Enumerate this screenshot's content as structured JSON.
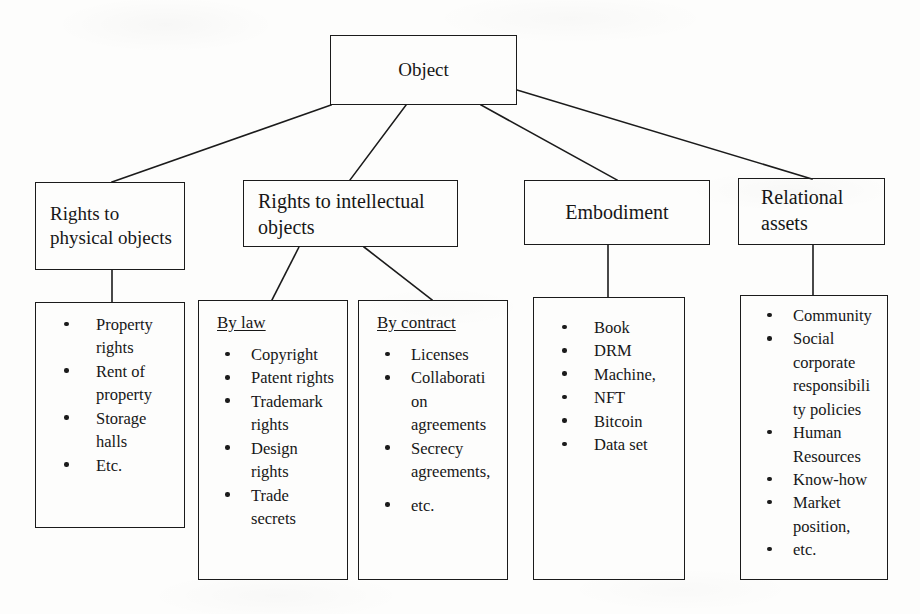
{
  "diagram": {
    "title_node": {
      "label": "Object"
    },
    "level2": [
      {
        "id": "rights-physical",
        "label": "Rights to\nphysical objects"
      },
      {
        "id": "rights-intellectual",
        "label": "Rights to intellectual\nobjects"
      },
      {
        "id": "embodiment",
        "label": "Embodiment"
      },
      {
        "id": "relational-assets",
        "label": "Relational\nassets"
      }
    ],
    "level3": [
      {
        "id": "physical-list",
        "heading": "",
        "items": [
          "Property rights",
          "Rent of property",
          "Storage halls",
          "Etc."
        ]
      },
      {
        "id": "by-law-list",
        "heading": "By law",
        "items": [
          "Copyright",
          "Patent rights",
          "Trademark rights",
          "Design rights",
          "Trade secrets"
        ]
      },
      {
        "id": "by-contract-list",
        "heading": "By contract",
        "items": [
          "Licenses",
          "Collaborati on agreements",
          "Secrecy agreements,",
          "etc."
        ]
      },
      {
        "id": "embodiment-list",
        "heading": "",
        "items": [
          "Book",
          "DRM",
          "Machine,",
          "NFT",
          "Bitcoin",
          "Data set"
        ]
      },
      {
        "id": "relational-list",
        "heading": "",
        "items": [
          "Community",
          "Social corporate responsibili ty policies",
          "Human Resources",
          "Know-how",
          "Market position,",
          "etc."
        ]
      }
    ],
    "colors": {
      "ink": "#1b1b1b",
      "paper": "#fdfdfc"
    }
  }
}
